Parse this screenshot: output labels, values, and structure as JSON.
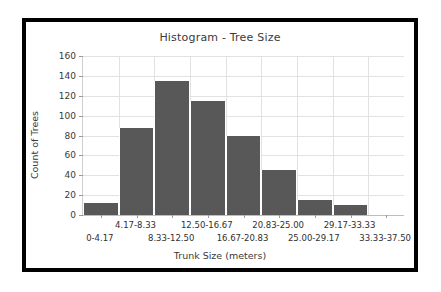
{
  "chart_data": {
    "type": "bar",
    "title": "Histogram - Tree Size",
    "xlabel": "Trunk Size (meters)",
    "ylabel": "Count of Trees",
    "categories": [
      "0-4.17",
      "4.17-8.33",
      "8.33-12.50",
      "12.50-16.67",
      "16.67-20.83",
      "20.83-25.00",
      "25.00-29.17",
      "29.17-33.33",
      "33.33-37.50"
    ],
    "values": [
      12,
      88,
      135,
      115,
      80,
      45,
      15,
      10,
      0
    ],
    "ylim": [
      0,
      160
    ],
    "yticks": [
      0,
      20,
      40,
      60,
      80,
      100,
      120,
      140,
      160
    ],
    "ytick_labels": [
      "0",
      "20",
      "40",
      "60",
      "80",
      "100",
      "120",
      "140",
      "160"
    ],
    "grid": true,
    "legend": false,
    "bar_color": "#585858",
    "frame_color": "#000000",
    "background_color": "#ffffff",
    "grid_color": "#e2e2e2"
  }
}
